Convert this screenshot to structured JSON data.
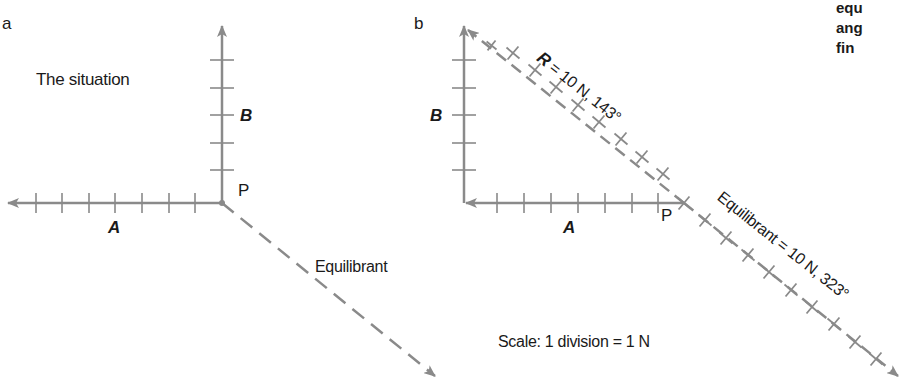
{
  "panel_a": {
    "letter": "a",
    "title": "The situation",
    "vector_a_label": "A",
    "vector_b_label": "B",
    "point_label": "P",
    "equilibrant_label": "Equilibrant",
    "vector_a_divisions": 8,
    "vector_b_divisions": 6
  },
  "panel_b": {
    "letter": "b",
    "vector_a_label": "A",
    "vector_b_label": "B",
    "point_label": "P",
    "resultant_symbol": "R",
    "resultant_text": " = 10 N, 143°",
    "equilibrant_text": "Equilibrant = 10 N, 323°",
    "scale_text": "Scale: 1 division = 1 N"
  },
  "side_text": {
    "lines": [
      "equ",
      "ang",
      "fin"
    ]
  },
  "colors": {
    "vector": "#8a8a8a",
    "text": "#1a1a1a"
  }
}
